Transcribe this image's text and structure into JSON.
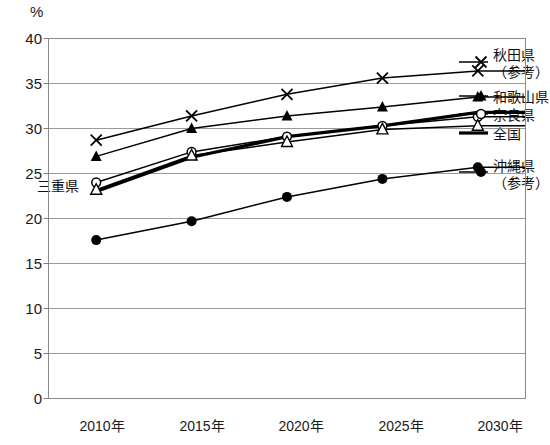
{
  "chart_data": {
    "type": "line",
    "title": "",
    "xlabel": "",
    "ylabel": "%",
    "unit_label": "%",
    "categories": [
      "2010年",
      "2015年",
      "2020年",
      "2025年",
      "2030年"
    ],
    "ylim": [
      0,
      40
    ],
    "ytick_step": 5,
    "yticks": [
      "40",
      "35",
      "30",
      "25",
      "20",
      "15",
      "10",
      "5",
      "0"
    ],
    "grid": "horizontal",
    "legend_position": "right-outside",
    "series": [
      {
        "name": "秋田県（参考）",
        "legend_line1": "秋田県",
        "legend_line2": "（参考）",
        "marker": "x-cross",
        "values": [
          28.7,
          31.4,
          33.8,
          35.6,
          36.4
        ]
      },
      {
        "name": "和歌山県",
        "legend_line1": "和歌山県",
        "legend_line2": "",
        "marker": "filled-triangle",
        "values": [
          26.9,
          30.0,
          31.4,
          32.4,
          33.5
        ]
      },
      {
        "name": "奈良県",
        "legend_line1": "奈良県",
        "legend_line2": "",
        "marker": "open-circle",
        "values": [
          24.0,
          27.4,
          29.1,
          30.3,
          31.3
        ]
      },
      {
        "name": "全国",
        "legend_line1": "全国",
        "legend_line2": "",
        "marker": "none-thick",
        "values": [
          23.0,
          26.8,
          29.1,
          30.3,
          31.8
        ]
      },
      {
        "name": "三重県",
        "legend_line1": "三重県",
        "legend_line2": "",
        "marker": "open-triangle",
        "values": [
          23.2,
          27.0,
          28.5,
          29.9,
          30.3
        ]
      },
      {
        "name": "沖縄県（参考）",
        "legend_line1": "沖縄県",
        "legend_line2": "（参考）",
        "marker": "filled-circle",
        "values": [
          17.6,
          19.7,
          22.4,
          24.4,
          25.7
        ]
      }
    ],
    "inline_labels": [
      {
        "text": "三重県",
        "series": "三重県"
      }
    ]
  },
  "colors": {
    "line": "#000000",
    "grid": "#808080",
    "frame": "#808080",
    "text": "#111111",
    "background": "#ffffff"
  }
}
